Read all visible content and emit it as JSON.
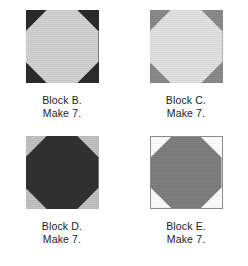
{
  "page": {
    "background_color": "#ffffff"
  },
  "blocks": [
    {
      "id": "block-b",
      "name_line": "Block B.",
      "quantity_line": "Make 7.",
      "corner_color": "#2b2b2b",
      "octagon_color": "#d2d2d2",
      "outlined": false,
      "shape": "octagon-in-square"
    },
    {
      "id": "block-c",
      "name_line": "Block C.",
      "quantity_line": "Make 7.",
      "corner_color": "#8a8a8a",
      "octagon_color": "#e2e2e2",
      "outlined": false,
      "shape": "octagon-in-square"
    },
    {
      "id": "block-d",
      "name_line": "Block D.",
      "quantity_line": "Make 7.",
      "corner_color": "#c2c2c2",
      "octagon_color": "#313131",
      "outlined": false,
      "shape": "octagon-in-square"
    },
    {
      "id": "block-e",
      "name_line": "Block E.",
      "quantity_line": "Make 7.",
      "corner_color": "#ffffff",
      "octagon_color": "#7f7f7f",
      "outlined": true,
      "shape": "octagon-in-square"
    }
  ]
}
